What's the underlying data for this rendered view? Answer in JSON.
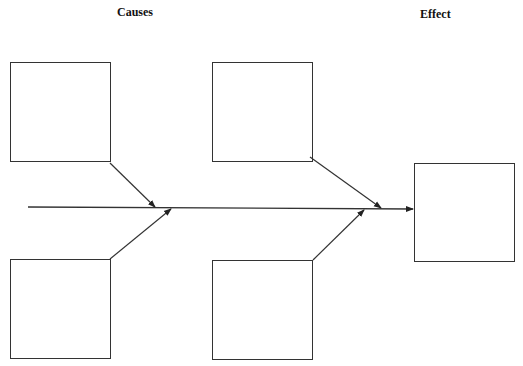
{
  "diagram": {
    "type": "fishbone",
    "headers": {
      "causes": "Causes",
      "effect": "Effect"
    },
    "cause_boxes": [
      {
        "id": "cause-top-left",
        "text": ""
      },
      {
        "id": "cause-top-right",
        "text": ""
      },
      {
        "id": "cause-bottom-left",
        "text": ""
      },
      {
        "id": "cause-bottom-right",
        "text": ""
      }
    ],
    "effect_box": {
      "text": ""
    },
    "colors": {
      "stroke": "#333333",
      "background": "#ffffff"
    }
  }
}
